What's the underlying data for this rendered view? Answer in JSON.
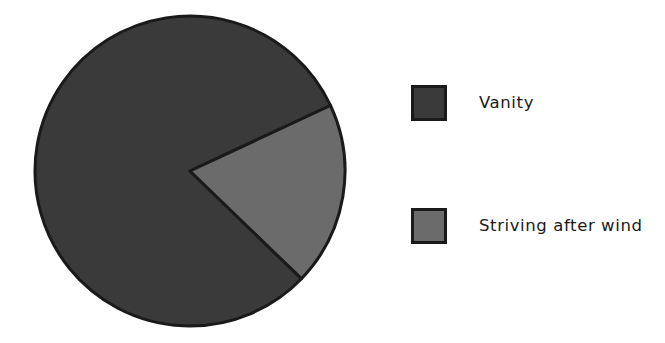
{
  "chart_data": {
    "type": "pie",
    "title": "",
    "categories": [
      "Vanity",
      "Striving after wind"
    ],
    "values": [
      81,
      19
    ],
    "value_unit": "percent",
    "start_angle_deg": -25,
    "direction": "counterclockwise",
    "labels_shown": false,
    "percent_labels_shown": false,
    "legend_position": "right",
    "legend": [
      {
        "label": "Vanity",
        "color": "#3a3a3a",
        "value": 81,
        "angle_deg": 291
      },
      {
        "label": "Striving after wind",
        "color": "#6b6b6b",
        "value": 19,
        "angle_deg": 69
      }
    ],
    "slice_edge_color": "#1a1a1a",
    "slice_edge_width": 3,
    "background_color": "#ffffff",
    "style": "xkcd-handwritten"
  },
  "figure": {
    "background_color": "#ffffff",
    "width": 665,
    "height": 343
  },
  "pie": {
    "center_x": 190,
    "center_y": 171,
    "radius": 155,
    "slices": [
      {
        "name": "vanity-slice",
        "label": "Vanity",
        "color": "#3a3a3a",
        "start_deg": 44,
        "end_deg": 335
      },
      {
        "name": "striving-after-wind-slice",
        "label": "Striving after wind",
        "color": "#6b6b6b",
        "start_deg": 335,
        "end_deg": 404
      }
    ]
  },
  "legend_block": {
    "entries": [
      {
        "swatch_color": "#3a3a3a",
        "label": "Vanity"
      },
      {
        "swatch_color": "#6b6b6b",
        "label": "Striving after wind"
      }
    ]
  }
}
